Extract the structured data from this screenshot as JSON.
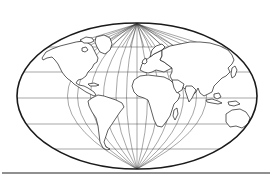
{
  "image": {
    "subject": "World map line drawing",
    "projection_style": "elliptical (pole-line) projection with graticule",
    "colors": {
      "background": "#ffffff",
      "ink": "#1a1a1a",
      "graticule": "#3a3a3a"
    },
    "ellipse": {
      "cx": 137,
      "cy": 96,
      "rx": 120,
      "ry": 73
    },
    "graticule": {
      "parallels_y": [
        47,
        72,
        98,
        124,
        149
      ],
      "meridian_count": 11
    },
    "regions": [
      "North America",
      "Greenland",
      "South America",
      "Europe",
      "Africa",
      "Madagascar",
      "Asia",
      "Japan",
      "Indonesia",
      "Australia"
    ],
    "baseline_rule_y": 173
  }
}
